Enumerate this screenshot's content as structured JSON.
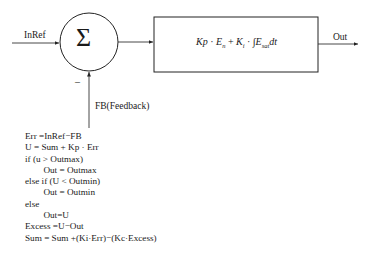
{
  "diagram": {
    "inputs": {
      "reference": "InRef",
      "feedback": "FB(Feedback)"
    },
    "summing_junction": {
      "symbol": "Σ",
      "minus_sign": "–"
    },
    "controller_block": {
      "formula": {
        "kp": "Kp",
        "dot1": " · ",
        "e": "E",
        "e_sub": "n",
        "plus": " + ",
        "ki": "K",
        "ki_sub": "i",
        "dot2": " · ",
        "integral": "∫",
        "e2": "E",
        "e2_sub": "sat",
        "dt": "dt"
      }
    },
    "output": "Out",
    "pseudocode": [
      "Err =InRef−FB",
      "U = Sum + Kp · Err",
      "if (u > Outmax)",
      "        Out = Outmax",
      "else if (U < Outmin)",
      "        Out = Outmin",
      "else",
      "        Out=U",
      "Excess =U−Out",
      "Sum = Sum +(Ki·Err)−(Kc·Excess)"
    ]
  }
}
